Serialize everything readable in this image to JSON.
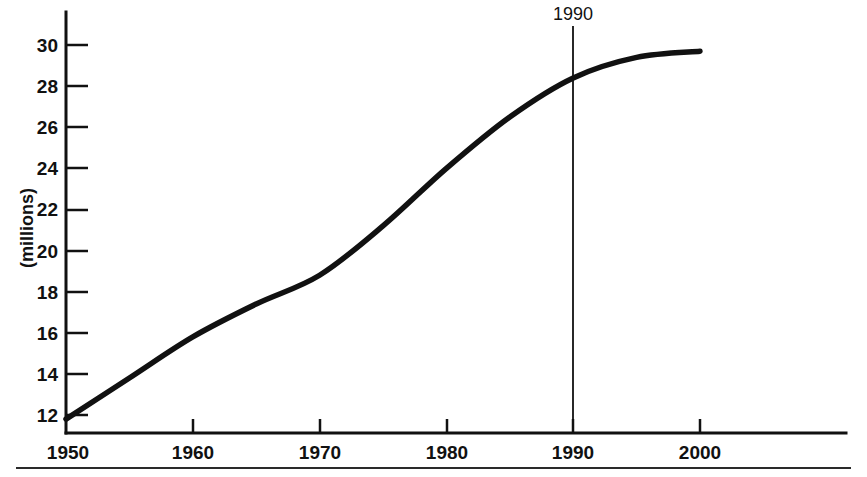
{
  "chart_data": {
    "type": "line",
    "title": "",
    "subtitle": "",
    "xlabel": "",
    "ylabel": "(millions)",
    "xlim": [
      1950,
      2010
    ],
    "ylim": [
      11,
      31
    ],
    "grid": false,
    "legend": null,
    "x_ticks": [
      "1950",
      "1960",
      "1970",
      "1980",
      "1990",
      "2000"
    ],
    "x_tick_values": [
      1950,
      1960,
      1970,
      1980,
      1990,
      2000
    ],
    "y_ticks": [
      "12",
      "14",
      "16",
      "18",
      "20",
      "22",
      "24",
      "26",
      "28",
      "30"
    ],
    "y_tick_values": [
      12,
      14,
      16,
      18,
      20,
      22,
      24,
      26,
      28,
      30
    ],
    "x": [
      1950,
      1955,
      1960,
      1965,
      1970,
      1975,
      1980,
      1985,
      1990,
      1995,
      2000
    ],
    "values": [
      11.8,
      13.8,
      15.8,
      17.4,
      18.8,
      21.2,
      24.0,
      26.5,
      28.4,
      29.4,
      29.7
    ],
    "series": [
      {
        "name": "population",
        "values": [
          11.8,
          13.8,
          15.8,
          17.4,
          18.8,
          21.2,
          24.0,
          26.5,
          28.4,
          29.4,
          29.7
        ]
      }
    ],
    "annotations": [
      {
        "name": "reference-line-1990",
        "label": "1990",
        "x_value": 1990,
        "type": "vertical-line"
      }
    ]
  },
  "axes": {
    "y_axis_title": "(millions)"
  },
  "annotation": {
    "year_label": "1990"
  }
}
